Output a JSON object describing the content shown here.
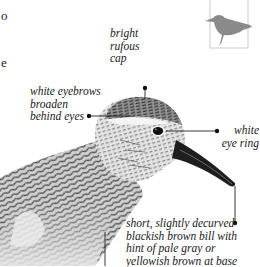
{
  "page": {
    "left_margin_fragments": [
      "o",
      "e"
    ]
  },
  "thumbnail": {
    "icon": "shorebird-silhouette-icon",
    "color": "#8a8a8a",
    "frame_color": "#bdbdbd"
  },
  "annotations": [
    {
      "id": "cap",
      "text": "bright\nrufous\ncap"
    },
    {
      "id": "eyebrows",
      "text": "white eyebrows\nbroaden\nbehind eyes"
    },
    {
      "id": "eye-ring",
      "text": "white\neye ring"
    },
    {
      "id": "bill",
      "text": "short, slightly decurved\nblackish brown bill with\nhint of pale gray or\nyellowish brown at base"
    }
  ],
  "colors": {
    "leader_line": "#222222",
    "plumage_dark": "#2a2a2a",
    "plumage_light": "#d9d9d9",
    "bill": "#1e1e1e"
  }
}
